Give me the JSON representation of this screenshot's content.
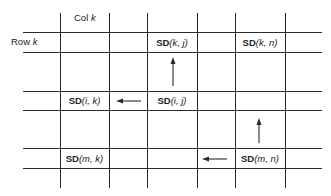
{
  "headers": {
    "col_label": "Col k",
    "row_label": "Row k"
  },
  "cells": [
    {
      "id": "sd-k-j",
      "prefix": "SD",
      "args": "(k, j)"
    },
    {
      "id": "sd-k-n",
      "prefix": "SD",
      "args": "(k, n)"
    },
    {
      "id": "sd-i-k",
      "prefix": "SD",
      "args": "(i, k)"
    },
    {
      "id": "sd-i-j",
      "prefix": "SD",
      "args": "(i, j)"
    },
    {
      "id": "sd-m-k",
      "prefix": "SD",
      "args": "(m, k)"
    },
    {
      "id": "sd-m-n",
      "prefix": "SD",
      "args": "(m, n)"
    }
  ],
  "arrows": [
    {
      "from": "SD(i, j)",
      "to": "SD(k, j)",
      "direction": "up"
    },
    {
      "from": "SD(i, j)",
      "to": "SD(i, k)",
      "direction": "left"
    },
    {
      "from": "SD(m, n)",
      "to": "SD(k, n)",
      "direction": "up"
    },
    {
      "from": "SD(m, n)",
      "to": "SD(m, k)",
      "direction": "left"
    }
  ],
  "colors": {
    "line": "#2a2a2a",
    "text": "#222222",
    "background": "#ffffff"
  }
}
